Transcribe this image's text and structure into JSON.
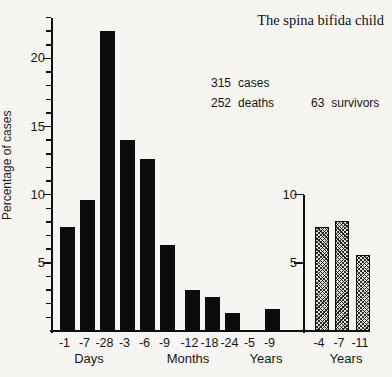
{
  "chart_data": {
    "type": "bar",
    "title": "The spina bifida child",
    "ylabel": "Percentage of cases",
    "ylim": [
      0,
      23
    ],
    "grid": false,
    "legend": "none",
    "stats": {
      "cases": {
        "value": "315",
        "label": "cases"
      },
      "deaths": {
        "value": "252",
        "label": "deaths"
      },
      "survivors": {
        "value": "63",
        "label": "survivors"
      }
    },
    "series": [
      {
        "name": "deaths (main axis)",
        "style": "solid-black",
        "categories": [
          "-1",
          "-7",
          "-28",
          "-3",
          "-6",
          "-9",
          "-12",
          "-18",
          "-24",
          "-5",
          "-9"
        ],
        "values": [
          7.6,
          9.6,
          22.0,
          14.0,
          12.6,
          6.3,
          3.0,
          2.5,
          1.3,
          0,
          1.6
        ],
        "group_labels": [
          "Days",
          "Months",
          "Years"
        ],
        "yticks": [
          5,
          10,
          15,
          20
        ]
      },
      {
        "name": "survivors (inset axis)",
        "style": "crosshatched",
        "categories": [
          "-4",
          "-7",
          "-11"
        ],
        "values": [
          7.6,
          8.1,
          5.6
        ],
        "group_labels": [
          "Years"
        ],
        "yticks": [
          5,
          10
        ]
      }
    ]
  },
  "colors": {
    "background": "#f7f5f1",
    "ink": "#101010",
    "hatch_fill": "#e3e0da"
  }
}
